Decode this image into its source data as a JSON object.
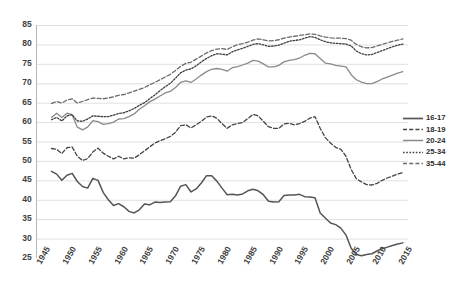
{
  "chart_data": {
    "type": "line",
    "title": "",
    "subtitle": "",
    "xlabel": "",
    "ylabel": "",
    "xlim": [
      1945,
      2017
    ],
    "ylim": [
      25,
      85
    ],
    "ytick_step": 5,
    "xtick_step": 5,
    "grid": "horizontal",
    "legend_position": "right",
    "yticks": [
      "85",
      "80",
      "75",
      "70",
      "65",
      "60",
      "55",
      "50",
      "45",
      "40",
      "35",
      "30",
      "25"
    ],
    "xticks": [
      "1945",
      "1950",
      "1955",
      "1960",
      "1965",
      "1970",
      "1975",
      "1980",
      "1985",
      "1990",
      "1995",
      "2000",
      "2005",
      "2010",
      "2015"
    ],
    "x_start": 1948,
    "x_end": 2016,
    "series": [
      {
        "name": "16-17",
        "style": "solid",
        "color": "#555555",
        "width": 1.5,
        "values": [
          47.3,
          46.6,
          45.0,
          46.3,
          46.8,
          44.7,
          43.4,
          43.0,
          45.5,
          45.0,
          41.9,
          40.0,
          38.5,
          39.0,
          38.2,
          37.0,
          36.6,
          37.4,
          38.9,
          38.7,
          39.4,
          39.3,
          39.4,
          39.5,
          41.0,
          43.5,
          43.9,
          42.0,
          42.8,
          44.3,
          46.2,
          46.2,
          44.8,
          43.0,
          41.3,
          41.4,
          41.2,
          41.5,
          42.3,
          42.7,
          42.3,
          41.3,
          39.6,
          39.4,
          39.5,
          41.1,
          41.2,
          41.2,
          41.4,
          40.8,
          40.7,
          40.5,
          36.6,
          35.3,
          34.0,
          33.6,
          32.7,
          30.9,
          27.5,
          25.9,
          25.6,
          25.9,
          26.1,
          26.8,
          27.4,
          27.8,
          28.2,
          28.6,
          28.9
        ]
      },
      {
        "name": "18-19",
        "style": "dashed",
        "color": "#444444",
        "width": 1.3,
        "values": [
          53.2,
          53.0,
          51.9,
          53.4,
          53.6,
          51.2,
          50.1,
          50.6,
          52.3,
          53.3,
          52.0,
          51.2,
          50.5,
          51.2,
          50.5,
          50.8,
          50.7,
          51.6,
          52.6,
          53.6,
          54.6,
          55.2,
          55.7,
          56.3,
          57.4,
          59.1,
          59.3,
          58.5,
          59.3,
          60.2,
          61.3,
          61.6,
          61.0,
          59.6,
          58.4,
          59.3,
          59.6,
          59.9,
          60.9,
          62.0,
          61.6,
          60.2,
          58.8,
          58.4,
          58.4,
          59.5,
          59.7,
          59.3,
          59.6,
          60.2,
          61.0,
          61.4,
          58.4,
          56.0,
          54.6,
          53.5,
          53.0,
          51.2,
          47.8,
          45.4,
          44.6,
          43.9,
          43.8,
          44.2,
          45.0,
          45.6,
          46.1,
          46.6,
          47.0
        ]
      },
      {
        "name": "20-24",
        "style": "solid",
        "color": "#8a8a8a",
        "width": 1.3,
        "values": [
          61.2,
          62.3,
          61.2,
          62.3,
          61.9,
          58.7,
          58.0,
          58.7,
          60.4,
          60.1,
          59.4,
          59.6,
          60.0,
          60.8,
          60.9,
          61.4,
          62.1,
          63.3,
          64.2,
          65.2,
          65.9,
          66.7,
          67.5,
          67.9,
          68.9,
          70.2,
          70.6,
          70.2,
          71.1,
          72.1,
          73.0,
          73.6,
          73.8,
          73.6,
          73.1,
          74.0,
          74.3,
          74.7,
          75.2,
          75.9,
          75.7,
          75.0,
          74.2,
          74.2,
          74.6,
          75.5,
          75.9,
          76.1,
          76.5,
          77.2,
          77.7,
          77.6,
          76.4,
          75.2,
          75.0,
          74.6,
          74.4,
          74.2,
          72.2,
          70.9,
          70.3,
          69.9,
          69.9,
          70.4,
          71.1,
          71.6,
          72.1,
          72.6,
          73.0
        ]
      },
      {
        "name": "25-34",
        "style": "dotted",
        "color": "#3d3d3d",
        "width": 1.3,
        "values": [
          60.6,
          61.2,
          60.3,
          61.6,
          61.9,
          60.3,
          60.2,
          60.8,
          61.6,
          61.5,
          61.4,
          61.4,
          61.8,
          62.2,
          62.4,
          62.9,
          63.5,
          64.3,
          65.0,
          66.0,
          67.0,
          68.1,
          69.1,
          70.0,
          71.3,
          72.7,
          73.4,
          73.7,
          74.5,
          75.5,
          76.4,
          77.1,
          77.6,
          77.5,
          77.3,
          78.1,
          78.6,
          79.0,
          79.5,
          80.0,
          80.2,
          79.9,
          79.5,
          79.6,
          79.8,
          80.3,
          80.8,
          81.0,
          81.2,
          81.6,
          82.0,
          81.8,
          81.2,
          80.7,
          80.4,
          80.3,
          80.2,
          80.1,
          79.6,
          78.3,
          77.6,
          77.3,
          77.4,
          77.9,
          78.4,
          78.9,
          79.4,
          79.8,
          80.1
        ]
      },
      {
        "name": "35-44",
        "style": "dashed",
        "color": "#6b6b6b",
        "width": 1.3,
        "values": [
          64.8,
          65.3,
          64.9,
          65.7,
          66.0,
          64.9,
          65.3,
          65.8,
          66.2,
          66.1,
          66.0,
          66.2,
          66.5,
          66.9,
          67.1,
          67.5,
          68.0,
          68.4,
          68.9,
          69.6,
          70.2,
          70.9,
          71.6,
          72.3,
          73.3,
          74.4,
          75.1,
          75.4,
          76.2,
          77.0,
          77.8,
          78.4,
          78.8,
          78.9,
          78.7,
          79.4,
          79.9,
          80.2,
          80.6,
          81.1,
          81.4,
          81.2,
          80.9,
          81.0,
          81.2,
          81.6,
          81.9,
          82.1,
          82.3,
          82.5,
          82.7,
          82.6,
          82.2,
          81.9,
          81.7,
          81.6,
          81.6,
          81.5,
          81.1,
          80.0,
          79.4,
          79.1,
          79.2,
          79.6,
          80.0,
          80.4,
          80.8,
          81.1,
          81.4
        ]
      }
    ]
  },
  "legend": {
    "items": [
      {
        "label": "16-17"
      },
      {
        "label": "18-19"
      },
      {
        "label": "20-24"
      },
      {
        "label": "25-34"
      },
      {
        "label": "35-44"
      }
    ]
  }
}
